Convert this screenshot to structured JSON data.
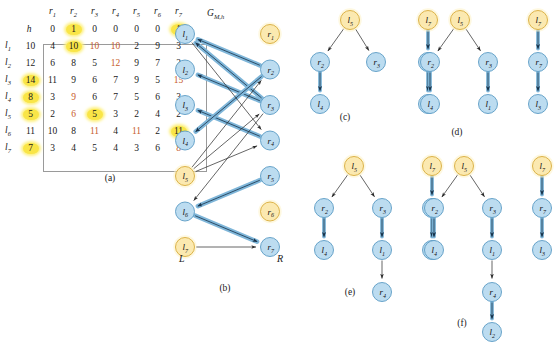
{
  "figure": {
    "panels": [
      "(a)",
      "(b)",
      "(c)",
      "(d)",
      "(e)",
      "(f)"
    ]
  },
  "colors": {
    "node_blue_fill": "#bcdcf0",
    "node_blue_stroke": "#5a9bc4",
    "node_yellow_fill": "#fbe9b0",
    "node_yellow_stroke": "#d8ab3a",
    "highlight_yellow": "#f9e547",
    "red_text": "#c75b2a",
    "edge_thick_blue": "#7fb6d9",
    "edge_thin_dark": "#333333",
    "matrix_border": "#9a9a9a"
  },
  "panel_a": {
    "caption": "(a)",
    "h_symbol": "h",
    "col_headers": [
      "r",
      "r",
      "r",
      "r",
      "r",
      "r",
      "r"
    ],
    "col_subs": [
      "1",
      "2",
      "3",
      "4",
      "5",
      "6",
      "7"
    ],
    "h_row": [
      {
        "v": "0",
        "hl": false
      },
      {
        "v": "1",
        "hl": true
      },
      {
        "v": "0",
        "hl": false
      },
      {
        "v": "0",
        "hl": false
      },
      {
        "v": "0",
        "hl": false
      },
      {
        "v": "0",
        "hl": false
      },
      {
        "v": "1",
        "hl": true
      }
    ],
    "row_labels": [
      "l",
      "l",
      "l",
      "l",
      "l",
      "l",
      "l"
    ],
    "row_subs": [
      "1",
      "2",
      "3",
      "4",
      "5",
      "6",
      "7"
    ],
    "row_h": [
      {
        "v": "10",
        "hl": false
      },
      {
        "v": "12",
        "hl": false
      },
      {
        "v": "14",
        "hl": true
      },
      {
        "v": "8",
        "hl": true
      },
      {
        "v": "5",
        "hl": true
      },
      {
        "v": "11",
        "hl": false
      },
      {
        "v": "7",
        "hl": true
      }
    ],
    "matrix": [
      [
        {
          "v": "4",
          "c": "k"
        },
        {
          "v": "10",
          "c": "k",
          "hl": true
        },
        {
          "v": "10",
          "c": "r"
        },
        {
          "v": "10",
          "c": "r"
        },
        {
          "v": "2",
          "c": "k"
        },
        {
          "v": "9",
          "c": "k"
        },
        {
          "v": "3",
          "c": "k"
        }
      ],
      [
        {
          "v": "6",
          "c": "k"
        },
        {
          "v": "8",
          "c": "k"
        },
        {
          "v": "5",
          "c": "k"
        },
        {
          "v": "12",
          "c": "r"
        },
        {
          "v": "9",
          "c": "k"
        },
        {
          "v": "7",
          "c": "k"
        },
        {
          "v": "2",
          "c": "k"
        }
      ],
      [
        {
          "v": "11",
          "c": "k"
        },
        {
          "v": "9",
          "c": "k"
        },
        {
          "v": "6",
          "c": "k"
        },
        {
          "v": "7",
          "c": "k"
        },
        {
          "v": "9",
          "c": "k"
        },
        {
          "v": "5",
          "c": "k"
        },
        {
          "v": "15",
          "c": "r"
        }
      ],
      [
        {
          "v": "3",
          "c": "k"
        },
        {
          "v": "9",
          "c": "r"
        },
        {
          "v": "6",
          "c": "k"
        },
        {
          "v": "7",
          "c": "k"
        },
        {
          "v": "5",
          "c": "k"
        },
        {
          "v": "6",
          "c": "k"
        },
        {
          "v": "3",
          "c": "k"
        }
      ],
      [
        {
          "v": "2",
          "c": "k"
        },
        {
          "v": "6",
          "c": "r"
        },
        {
          "v": "5",
          "c": "k",
          "hl": true
        },
        {
          "v": "3",
          "c": "k"
        },
        {
          "v": "2",
          "c": "k"
        },
        {
          "v": "4",
          "c": "k"
        },
        {
          "v": "2",
          "c": "k"
        }
      ],
      [
        {
          "v": "10",
          "c": "k"
        },
        {
          "v": "8",
          "c": "k"
        },
        {
          "v": "11",
          "c": "r"
        },
        {
          "v": "4",
          "c": "k"
        },
        {
          "v": "11",
          "c": "r"
        },
        {
          "v": "2",
          "c": "k"
        },
        {
          "v": "11",
          "c": "k",
          "hl": true
        }
      ],
      [
        {
          "v": "3",
          "c": "k"
        },
        {
          "v": "4",
          "c": "k"
        },
        {
          "v": "5",
          "c": "k"
        },
        {
          "v": "4",
          "c": "k"
        },
        {
          "v": "3",
          "c": "k"
        },
        {
          "v": "6",
          "c": "k"
        },
        {
          "v": "8",
          "c": "r"
        }
      ]
    ]
  },
  "panel_b": {
    "caption": "(b)",
    "title": "G",
    "title_sub": "M,h",
    "left_label": "L",
    "right_label": "R",
    "left_nodes": [
      {
        "id": "l1",
        "label": "l",
        "sub": "1",
        "color": "blue"
      },
      {
        "id": "l2",
        "label": "l",
        "sub": "2",
        "color": "blue"
      },
      {
        "id": "l3",
        "label": "l",
        "sub": "3",
        "color": "blue"
      },
      {
        "id": "l4",
        "label": "l",
        "sub": "4",
        "color": "blue"
      },
      {
        "id": "l5",
        "label": "l",
        "sub": "5",
        "color": "yellow"
      },
      {
        "id": "l6",
        "label": "l",
        "sub": "6",
        "color": "blue"
      },
      {
        "id": "l7",
        "label": "l",
        "sub": "7",
        "color": "yellow"
      }
    ],
    "right_nodes": [
      {
        "id": "r1",
        "label": "r",
        "sub": "1",
        "color": "yellow"
      },
      {
        "id": "r2",
        "label": "r",
        "sub": "2",
        "color": "blue"
      },
      {
        "id": "r3",
        "label": "r",
        "sub": "3",
        "color": "blue"
      },
      {
        "id": "r4",
        "label": "r",
        "sub": "4",
        "color": "blue"
      },
      {
        "id": "r5",
        "label": "r",
        "sub": "5",
        "color": "blue"
      },
      {
        "id": "r6",
        "label": "r",
        "sub": "6",
        "color": "yellow"
      },
      {
        "id": "r7",
        "label": "r",
        "sub": "7",
        "color": "blue"
      }
    ],
    "edges_thick": [
      {
        "from": "r2",
        "to": "l1"
      },
      {
        "from": "r3",
        "to": "l1"
      },
      {
        "from": "r3",
        "to": "l2"
      },
      {
        "from": "r4",
        "to": "l3"
      },
      {
        "from": "r2",
        "to": "l4"
      },
      {
        "from": "r5",
        "to": "l6"
      },
      {
        "from": "l6",
        "to": "r7"
      }
    ],
    "edges_thin": [
      {
        "from": "l5",
        "to": "r2"
      },
      {
        "from": "l5",
        "to": "r3"
      },
      {
        "from": "l5",
        "to": "r4"
      },
      {
        "from": "l1",
        "to": "r4"
      },
      {
        "from": "l7",
        "to": "r7"
      },
      {
        "from": "r3",
        "to": "l6"
      }
    ]
  },
  "panel_c": {
    "caption": "(c)",
    "trees": [
      {
        "nodes": [
          {
            "id": "l5",
            "label": "l",
            "sub": "5",
            "color": "yellow",
            "x": 54,
            "y": 14
          },
          {
            "id": "r2",
            "label": "r",
            "sub": "2",
            "color": "blue",
            "x": 24,
            "y": 56
          },
          {
            "id": "r3",
            "label": "r",
            "sub": "3",
            "color": "blue",
            "x": 80,
            "y": 56
          },
          {
            "id": "l4",
            "label": "l",
            "sub": "4",
            "color": "blue",
            "x": 24,
            "y": 98
          }
        ],
        "edges": [
          {
            "from": "l5",
            "to": "r2",
            "style": "thin"
          },
          {
            "from": "l5",
            "to": "r3",
            "style": "thin"
          },
          {
            "from": "r2",
            "to": "l4",
            "style": "thick"
          }
        ]
      },
      {
        "nodes": [
          {
            "id": "l7",
            "label": "l",
            "sub": "7",
            "color": "yellow",
            "x": 132,
            "y": 14
          },
          {
            "id": "r7",
            "label": "r",
            "sub": "7",
            "color": "blue",
            "x": 132,
            "y": 56
          },
          {
            "id": "l3",
            "label": "l",
            "sub": "3",
            "color": "blue",
            "x": 132,
            "y": 98
          }
        ],
        "edges": [
          {
            "from": "l7",
            "to": "r7",
            "style": "thick"
          },
          {
            "from": "r7",
            "to": "l3",
            "style": "thick"
          }
        ]
      }
    ]
  },
  "panel_d": {
    "caption": "(d)",
    "trees": [
      {
        "nodes": [
          {
            "id": "l5",
            "label": "l",
            "sub": "5",
            "color": "yellow",
            "x": 54,
            "y": 14
          },
          {
            "id": "r2",
            "label": "r",
            "sub": "2",
            "color": "blue",
            "x": 24,
            "y": 56
          },
          {
            "id": "r3",
            "label": "r",
            "sub": "3",
            "color": "blue",
            "x": 82,
            "y": 56
          },
          {
            "id": "l4",
            "label": "l",
            "sub": "4",
            "color": "blue",
            "x": 24,
            "y": 98
          },
          {
            "id": "l1",
            "label": "l",
            "sub": "1",
            "color": "blue",
            "x": 82,
            "y": 98
          }
        ],
        "edges": [
          {
            "from": "l5",
            "to": "r2",
            "style": "thin"
          },
          {
            "from": "l5",
            "to": "r3",
            "style": "thin"
          },
          {
            "from": "r2",
            "to": "l4",
            "style": "thick"
          },
          {
            "from": "r3",
            "to": "l1",
            "style": "thick"
          }
        ]
      },
      {
        "nodes": [
          {
            "id": "l7",
            "label": "l",
            "sub": "7",
            "color": "yellow",
            "x": 132,
            "y": 14
          },
          {
            "id": "r7",
            "label": "r",
            "sub": "7",
            "color": "blue",
            "x": 132,
            "y": 56
          },
          {
            "id": "l3",
            "label": "l",
            "sub": "3",
            "color": "blue",
            "x": 132,
            "y": 98
          }
        ],
        "edges": [
          {
            "from": "l7",
            "to": "r7",
            "style": "thick"
          },
          {
            "from": "r7",
            "to": "l3",
            "style": "thick"
          }
        ]
      }
    ]
  },
  "panel_e": {
    "caption": "(e)",
    "trees": [
      {
        "nodes": [
          {
            "id": "l5",
            "label": "l",
            "sub": "5",
            "color": "yellow",
            "x": 54,
            "y": 14
          },
          {
            "id": "r2",
            "label": "r",
            "sub": "2",
            "color": "blue",
            "x": 24,
            "y": 56
          },
          {
            "id": "r3",
            "label": "r",
            "sub": "3",
            "color": "blue",
            "x": 82,
            "y": 56
          },
          {
            "id": "l4",
            "label": "l",
            "sub": "4",
            "color": "blue",
            "x": 24,
            "y": 98
          },
          {
            "id": "l1",
            "label": "l",
            "sub": "1",
            "color": "blue",
            "x": 82,
            "y": 98
          },
          {
            "id": "r4",
            "label": "r",
            "sub": "4",
            "color": "blue",
            "x": 82,
            "y": 140
          }
        ],
        "edges": [
          {
            "from": "l5",
            "to": "r2",
            "style": "thin"
          },
          {
            "from": "l5",
            "to": "r3",
            "style": "thin"
          },
          {
            "from": "r2",
            "to": "l4",
            "style": "thick"
          },
          {
            "from": "r3",
            "to": "l1",
            "style": "thick"
          },
          {
            "from": "l1",
            "to": "r4",
            "style": "thin"
          }
        ]
      },
      {
        "nodes": [
          {
            "id": "l7",
            "label": "l",
            "sub": "7",
            "color": "yellow",
            "x": 132,
            "y": 14
          },
          {
            "id": "r7",
            "label": "r",
            "sub": "7",
            "color": "blue",
            "x": 132,
            "y": 56
          },
          {
            "id": "l3",
            "label": "l",
            "sub": "3",
            "color": "blue",
            "x": 132,
            "y": 98
          }
        ],
        "edges": [
          {
            "from": "l7",
            "to": "r7",
            "style": "thick"
          },
          {
            "from": "r7",
            "to": "l3",
            "style": "thick"
          }
        ]
      }
    ]
  },
  "panel_f": {
    "caption": "(f)",
    "trees": [
      {
        "nodes": [
          {
            "id": "l5",
            "label": "l",
            "sub": "5",
            "color": "yellow",
            "x": 54,
            "y": 14
          },
          {
            "id": "r2",
            "label": "r",
            "sub": "2",
            "color": "blue",
            "x": 24,
            "y": 56
          },
          {
            "id": "r3",
            "label": "r",
            "sub": "3",
            "color": "blue",
            "x": 82,
            "y": 56
          },
          {
            "id": "l4",
            "label": "l",
            "sub": "4",
            "color": "blue",
            "x": 24,
            "y": 98
          },
          {
            "id": "l1",
            "label": "l",
            "sub": "1",
            "color": "blue",
            "x": 82,
            "y": 98
          },
          {
            "id": "r4",
            "label": "r",
            "sub": "4",
            "color": "blue",
            "x": 82,
            "y": 140
          },
          {
            "id": "l2",
            "label": "l",
            "sub": "2",
            "color": "blue",
            "x": 82,
            "y": 180
          }
        ],
        "edges": [
          {
            "from": "l5",
            "to": "r2",
            "style": "thin"
          },
          {
            "from": "l5",
            "to": "r3",
            "style": "thin"
          },
          {
            "from": "r2",
            "to": "l4",
            "style": "thick"
          },
          {
            "from": "r3",
            "to": "l1",
            "style": "thick"
          },
          {
            "from": "l1",
            "to": "r4",
            "style": "thin"
          },
          {
            "from": "r4",
            "to": "l2",
            "style": "thick"
          }
        ]
      },
      {
        "nodes": [
          {
            "id": "l7",
            "label": "l",
            "sub": "7",
            "color": "yellow",
            "x": 132,
            "y": 14
          },
          {
            "id": "r7",
            "label": "r",
            "sub": "7",
            "color": "blue",
            "x": 132,
            "y": 56
          },
          {
            "id": "l3",
            "label": "l",
            "sub": "3",
            "color": "blue",
            "x": 132,
            "y": 98
          }
        ],
        "edges": [
          {
            "from": "l7",
            "to": "r7",
            "style": "thick"
          },
          {
            "from": "r7",
            "to": "l3",
            "style": "thick"
          }
        ]
      }
    ]
  }
}
